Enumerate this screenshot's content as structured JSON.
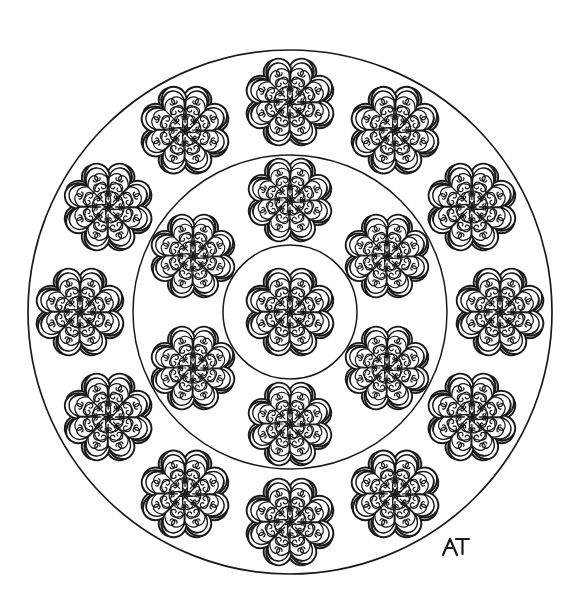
{
  "artwork": {
    "title": "Floral Mandala Coloring Page",
    "description": "Black and white line-art mandala with three concentric circles filled with eight-petal scrollwork flowers",
    "signature": "AT",
    "background_color": "#ffffff",
    "line_color": "#1a1a1a",
    "canvas": {
      "width": 568,
      "height": 606
    }
  },
  "geometry": {
    "center": {
      "x": 290,
      "y": 312
    },
    "circles": [
      {
        "name": "outer-circle",
        "radius": 262,
        "stroke_width": 1.7
      },
      {
        "name": "middle-circle",
        "radius": 157,
        "stroke_width": 1.5
      },
      {
        "name": "inner-circle",
        "radius": 67,
        "stroke_width": 1.5
      }
    ],
    "flower_rings": [
      {
        "name": "outer-ring",
        "count": 12,
        "orbit_radius": 210,
        "flower_radius": 42,
        "start_angle_deg": -90
      },
      {
        "name": "middle-ring",
        "count": 6,
        "orbit_radius": 112,
        "flower_radius": 40,
        "start_angle_deg": -90
      },
      {
        "name": "center-flower",
        "count": 1,
        "orbit_radius": 0,
        "flower_radius": 42,
        "start_angle_deg": -90
      }
    ],
    "flower": {
      "petal_count": 8,
      "petal_shape": "heart",
      "has_inner_outline": true,
      "has_center_spokes": true,
      "scroll_curls_per_petal": 2
    },
    "signature_position": {
      "x": 452,
      "y": 545
    }
  },
  "colors": {
    "ink": "#1a1a1a",
    "paper": "#ffffff"
  }
}
